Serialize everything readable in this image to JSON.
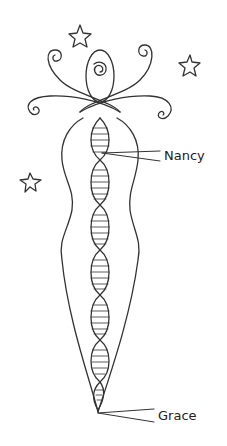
{
  "illustration": {
    "subject": "stylized female figure containing a DNA double helix, surrounded by stars and spiral curls",
    "labels": {
      "upper": "Nancy",
      "lower": "Grace"
    },
    "stars_count": 3,
    "stroke_color": "#333333",
    "background_color": "#ffffff"
  }
}
